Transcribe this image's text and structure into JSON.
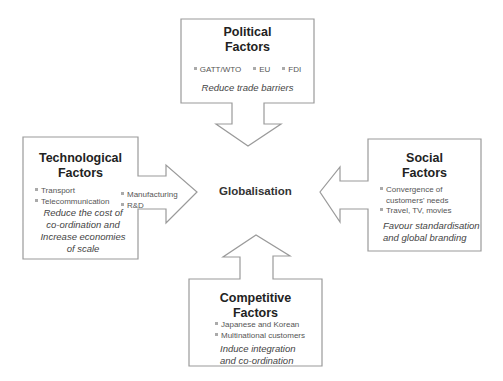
{
  "center": {
    "label": "Globalisation"
  },
  "political": {
    "title_line1": "Political",
    "title_line2": "Factors",
    "bullets": [
      "GATT/WTO",
      "EU",
      "FDI"
    ],
    "note": "Reduce trade barriers"
  },
  "technological": {
    "title_line1": "Technological",
    "title_line2": "Factors",
    "bullets_left": [
      "Transport",
      "Telecommunication"
    ],
    "bullets_right": [
      "Manufacturing",
      "R&D"
    ],
    "note_lines": [
      "Reduce the cost of",
      "co-ordination and",
      "Increase economies",
      "of scale"
    ]
  },
  "social": {
    "title_line1": "Social",
    "title_line2": "Factors",
    "bullets": [
      "Convergence of",
      "customers' needs",
      "Travel, TV, movies"
    ],
    "note_lines": [
      "Favour standardisation",
      "and global branding"
    ]
  },
  "competitive": {
    "title_line1": "Competitive",
    "title_line2": "Factors",
    "bullets": [
      "Japanese and Korean",
      "Multinational customers"
    ],
    "note_lines": [
      "Induce integration",
      "and co-ordination"
    ]
  },
  "colors": {
    "stroke": "#9a9a9a",
    "bullet": "#aaaaaa",
    "text": "#555555"
  }
}
